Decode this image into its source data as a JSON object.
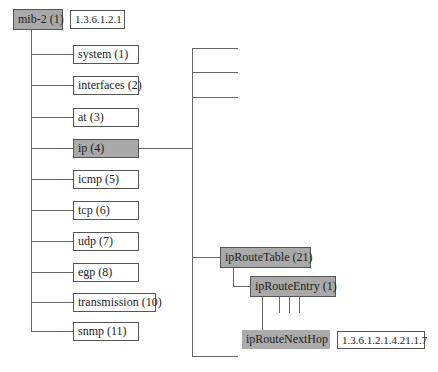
{
  "root": {
    "label": "mib-2 (1)",
    "oid": "1.3.6.1.2.1"
  },
  "children": [
    {
      "label": "system (1)"
    },
    {
      "label": "interfaces (2)"
    },
    {
      "label": "at (3)"
    },
    {
      "label": "ip (4)",
      "highlighted": true
    },
    {
      "label": "icmp (5)"
    },
    {
      "label": "tcp (6)"
    },
    {
      "label": "udp (7)"
    },
    {
      "label": "egp (8)"
    },
    {
      "label": "transmission (10)"
    },
    {
      "label": "snmp (11)"
    }
  ],
  "ip_subtree": {
    "table": {
      "label": "ipRouteTable (21)"
    },
    "entry": {
      "label": "ipRouteEntry (1)"
    },
    "leaf": {
      "label": "ipRouteNextHop",
      "oid": "1.3.6.1.2.1.4.21.1.7"
    }
  },
  "colors": {
    "highlight": "#a9a9a9",
    "line": "#666666",
    "border": "#555555"
  }
}
